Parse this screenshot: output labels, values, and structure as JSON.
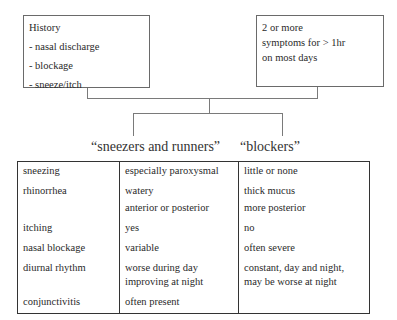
{
  "boxes": {
    "history": {
      "title": "History",
      "items": [
        "- nasal discharge",
        "- blockage",
        "- sneeze/itch"
      ]
    },
    "criteria": {
      "lines": [
        "2 or more",
        "symptoms for > 1hr",
        "on most days"
      ]
    }
  },
  "headings": {
    "left": "“sneezers and runners”",
    "right": "“blockers”"
  },
  "table": {
    "rows": [
      {
        "feature": "sneezing",
        "sneezers": [
          "especially paroxysmal"
        ],
        "blockers": [
          "little or none"
        ]
      },
      {
        "feature": "rhinorrhea",
        "sneezers": [
          "watery",
          "anterior or posterior"
        ],
        "blockers": [
          "thick mucus",
          "more posterior"
        ]
      },
      {
        "feature": "itching",
        "sneezers": [
          "yes"
        ],
        "blockers": [
          "no"
        ]
      },
      {
        "feature": "nasal blockage",
        "sneezers": [
          "variable"
        ],
        "blockers": [
          "often severe"
        ]
      },
      {
        "feature": "diurnal rhythm",
        "sneezers": [
          "worse during day improving at night"
        ],
        "blockers": [
          "constant, day and night, may be worse at night"
        ]
      },
      {
        "feature": "conjunctivitis",
        "sneezers": [
          "often present"
        ],
        "blockers": [
          ""
        ]
      }
    ]
  }
}
